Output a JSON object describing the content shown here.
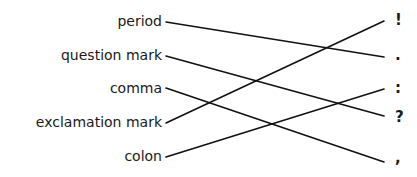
{
  "left_terms": [
    {
      "label": "period",
      "y": 13
    },
    {
      "label": "question mark",
      "y": 47
    },
    {
      "label": "comma",
      "y": 80
    },
    {
      "label": "exclamation mark",
      "y": 114
    },
    {
      "label": "colon",
      "y": 148
    }
  ],
  "right_symbols": [
    {
      "label": "!",
      "y": 12
    },
    {
      "label": ".",
      "y": 47
    },
    {
      "label": ":",
      "y": 80
    },
    {
      "label": "?",
      "y": 109
    },
    {
      "label": ",",
      "y": 150
    }
  ],
  "connections": [
    {
      "from": "period",
      "to": "."
    },
    {
      "from": "question mark",
      "to": "?"
    },
    {
      "from": "comma",
      "to": ","
    },
    {
      "from": "exclamation mark",
      "to": "!"
    },
    {
      "from": "colon",
      "to": ":"
    }
  ],
  "line_color": "#111111"
}
